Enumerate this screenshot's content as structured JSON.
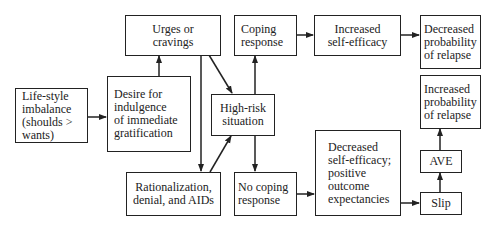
{
  "diagram": {
    "title": "",
    "nodes": {
      "lifestyle": {
        "label": "Life-style\nimbalance\n(shoulds >\nwants)"
      },
      "desire": {
        "label": "Desire for\nindulgence\nof immediate\ngratification"
      },
      "urges": {
        "label": "Urges or cravings"
      },
      "rationalization": {
        "label": "Rationalization,\ndenial, and AIDs"
      },
      "highrisk": {
        "label": "High-risk\nsituation"
      },
      "coping": {
        "label": "Coping\nresponse"
      },
      "nocoping": {
        "label": "No coping\nresponse"
      },
      "inc_efficacy": {
        "label": "Increased\nself-efficacy"
      },
      "dec_efficacy": {
        "label": "Decreased\nself-efficacy;\npositive\noutcome\nexpectancies"
      },
      "dec_prob": {
        "label": "Decreased\nprobability\nof relapse"
      },
      "inc_prob": {
        "label": "Increased\nprobability\nof relapse"
      },
      "ave": {
        "label": "AVE"
      },
      "slip": {
        "label": "Slip"
      }
    },
    "edges": [
      {
        "from": "lifestyle",
        "to": "desire"
      },
      {
        "from": "desire",
        "to": "urges"
      },
      {
        "from": "urges",
        "to": "highrisk"
      },
      {
        "from": "urges",
        "to": "rationalization"
      },
      {
        "from": "rationalization",
        "to": "highrisk"
      },
      {
        "from": "highrisk",
        "to": "coping"
      },
      {
        "from": "highrisk",
        "to": "nocoping"
      },
      {
        "from": "coping",
        "to": "inc_efficacy"
      },
      {
        "from": "inc_efficacy",
        "to": "dec_prob"
      },
      {
        "from": "nocoping",
        "to": "dec_efficacy"
      },
      {
        "from": "dec_efficacy",
        "to": "slip"
      },
      {
        "from": "slip",
        "to": "ave"
      },
      {
        "from": "ave",
        "to": "inc_prob"
      }
    ],
    "colors": {
      "stroke": "#222222",
      "background": "#ffffff",
      "text": "#222222"
    }
  }
}
